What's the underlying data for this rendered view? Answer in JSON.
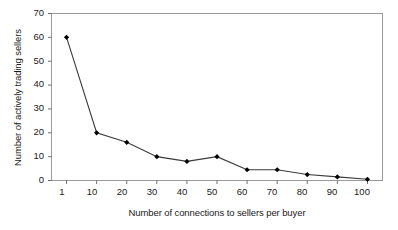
{
  "chart_data": {
    "type": "line",
    "title": "",
    "xlabel": "Number of connections to sellers per buyer",
    "ylabel": "Number of actively trading sellers",
    "categories": [
      "1",
      "10",
      "20",
      "30",
      "40",
      "50",
      "60",
      "70",
      "80",
      "90",
      "100"
    ],
    "values": [
      60,
      20,
      16,
      10,
      8,
      10,
      4.5,
      4.5,
      2.5,
      1.5,
      0.5
    ],
    "series": [
      {
        "name": "Number of actively trading sellers",
        "values": [
          60,
          20,
          16,
          10,
          8,
          10,
          4.5,
          4.5,
          2.5,
          1.5,
          0.5
        ]
      }
    ],
    "yticks": [
      0,
      10,
      20,
      30,
      40,
      50,
      60,
      70
    ],
    "ytick_labels": [
      "0",
      "10",
      "20",
      "30",
      "40",
      "50",
      "60",
      "70"
    ],
    "xtick_labels": [
      "1",
      "10",
      "20",
      "30",
      "40",
      "50",
      "60",
      "70",
      "80",
      "90",
      "100"
    ],
    "ylim": [
      0,
      70
    ],
    "grid": false,
    "legend": false,
    "legend_position": "none",
    "marker": "diamond",
    "line_color": "#3a3a3a",
    "marker_color": "#000000",
    "frame_color": "#9a9a9a",
    "background": "#ffffff"
  }
}
